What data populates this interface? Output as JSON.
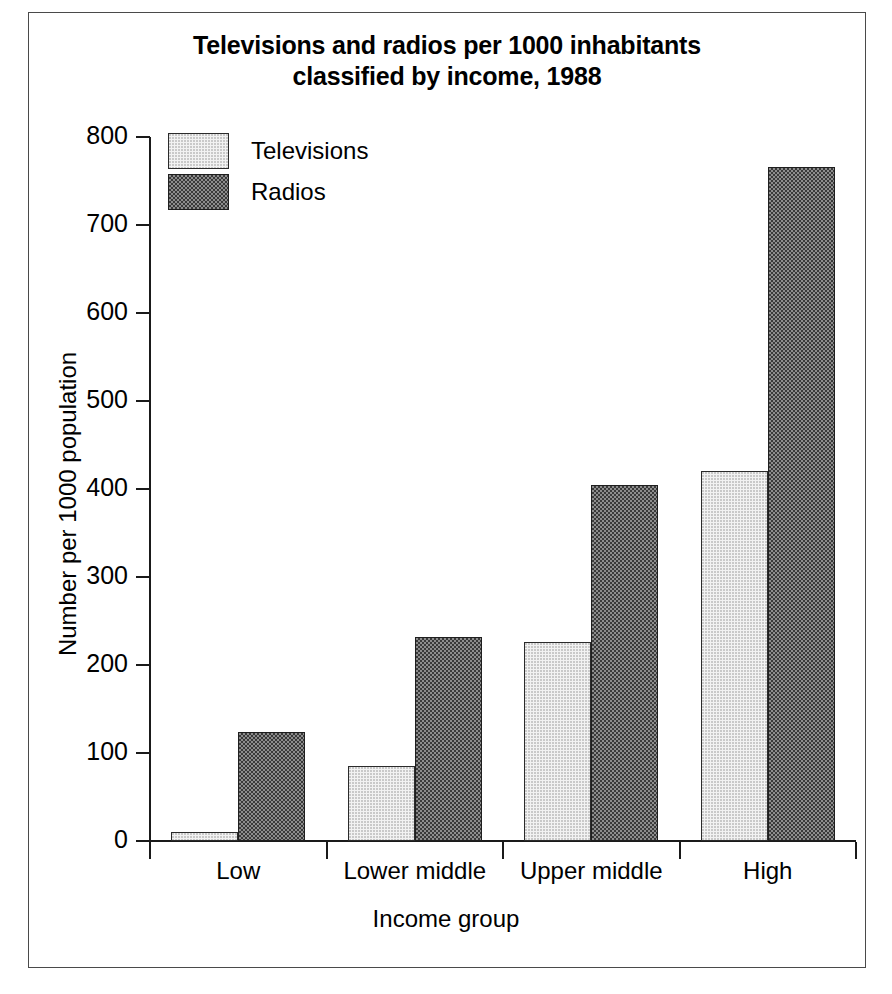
{
  "chart_data": {
    "type": "bar",
    "title": "Televisions and radios per 1000 inhabitants classified by income, 1988",
    "title_line1": "Televisions and radios per 1000 inhabitants",
    "title_line2": "classified by income, 1988",
    "xlabel": "Income group",
    "ylabel": "Number per 1000 population",
    "categories": [
      "Low",
      "Lower middle",
      "Upper middle",
      "High"
    ],
    "series": [
      {
        "name": "Televisions",
        "values": [
          10,
          85,
          226,
          420
        ],
        "color": "#f2f2f2"
      },
      {
        "name": "Radios",
        "values": [
          124,
          232,
          405,
          766
        ],
        "color": "#6a6a6a"
      }
    ],
    "ylim": [
      0,
      800
    ],
    "ytick_labels": [
      "0",
      "100",
      "200",
      "300",
      "400",
      "500",
      "600",
      "700",
      "800"
    ],
    "ytick_values": [
      0,
      100,
      200,
      300,
      400,
      500,
      600,
      700,
      800
    ],
    "grid": false,
    "legend_position": "top-left-inside"
  },
  "legend": {
    "items": [
      {
        "label": "Televisions",
        "swatch": "tv"
      },
      {
        "label": "Radios",
        "swatch": "radio"
      }
    ]
  }
}
